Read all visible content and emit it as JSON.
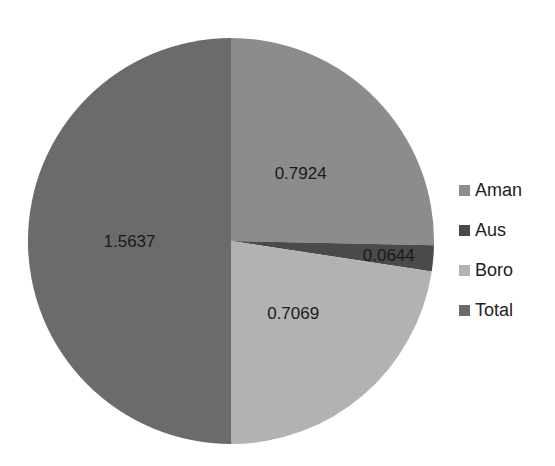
{
  "chart_data": {
    "type": "pie",
    "title": "",
    "categories": [
      "Aman",
      "Aus",
      "Boro",
      "Total"
    ],
    "values": [
      0.7924,
      0.0644,
      0.7069,
      1.5637
    ],
    "data_labels": [
      "0.7924",
      "0.0644",
      "0.7069",
      "1.5637"
    ],
    "colors": [
      "#8c8c8c",
      "#4a4a4a",
      "#b2b2b2",
      "#6b6b6b"
    ],
    "start_angle": "12 o'clock, clockwise",
    "legend_position": "right"
  },
  "legend": {
    "items": [
      {
        "label": "Aman",
        "color": "#8c8c8c"
      },
      {
        "label": "Aus",
        "color": "#4a4a4a"
      },
      {
        "label": "Boro",
        "color": "#b2b2b2"
      },
      {
        "label": "Total",
        "color": "#6b6b6b"
      }
    ]
  }
}
